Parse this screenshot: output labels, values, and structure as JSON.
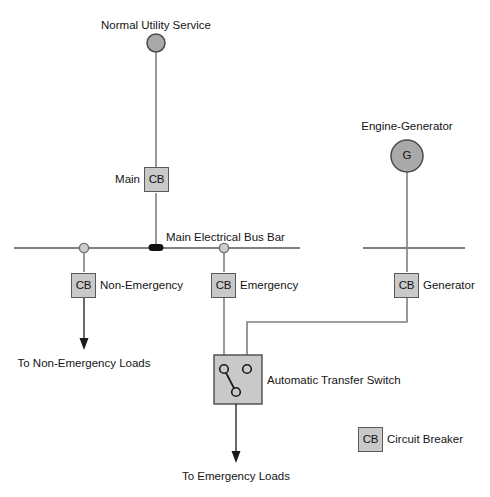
{
  "diagram": {
    "sources": {
      "utility": {
        "label": "Normal Utility Service",
        "symbol": "circle-source"
      },
      "generator": {
        "label": "Engine-Generator",
        "symbol": "G",
        "symbol_name": "generator-circle"
      }
    },
    "bus": {
      "label": "Main Electrical Bus Bar"
    },
    "breakers": [
      {
        "tag": "CB",
        "label": "Main",
        "label_side": "left",
        "name": "main"
      },
      {
        "tag": "CB",
        "label": "Non-Emergency",
        "label_side": "right",
        "name": "non-emergency"
      },
      {
        "tag": "CB",
        "label": "Emergency",
        "label_side": "right",
        "name": "emergency"
      },
      {
        "tag": "CB",
        "label": "Generator",
        "label_side": "right",
        "name": "generator"
      }
    ],
    "transfer_switch": {
      "label": "Automatic Transfer Switch",
      "abbreviation": "ATS",
      "terminals": [
        "normal-source",
        "emergency-source",
        "load"
      ],
      "selected_source": "normal-source"
    },
    "loads": [
      {
        "label": "To Non-Emergency Loads",
        "name": "non-emergency-loads"
      },
      {
        "label": "To Emergency Loads",
        "name": "emergency-loads"
      }
    ],
    "legend": {
      "tag": "CB",
      "label": "Circuit Breaker"
    },
    "colors": {
      "wire": "#808080",
      "arrow": "#1a1a1a",
      "box_fill": "#c9c9c9",
      "box_stroke": "#5a5a5a",
      "source_fill": "#a9a9a9",
      "text": "#141414",
      "background": "#ffffff"
    }
  }
}
